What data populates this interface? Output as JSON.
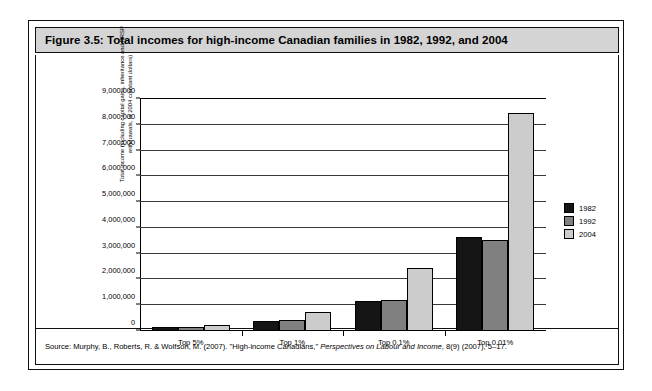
{
  "figure": {
    "title": "Figure 3.5: Total incomes for high-income Canadian families in 1982, 1992, and 2004",
    "source_prefix": "Source: Murphy, B., Roberts, R. & Wolfson, M. (2007). \"High-income Canadians,\" ",
    "source_italic": "Perspectives on Labour and Income",
    "source_suffix": ", 8(9) (2007), 5–17."
  },
  "colors": {
    "y1982": "#151515",
    "y1992": "#808080",
    "y2004": "#cccccc",
    "title_band": "#d4d4d4",
    "frame": "#101010"
  },
  "chart_data": {
    "type": "bar",
    "title": "Figure 3.5: Total incomes for high-income Canadian families in 1982, 1992, and 2004",
    "xlabel": "",
    "ylabel": "Total income (including capital gains, inheritance and RRSP withdrawals, in 2004 constant dollars)",
    "ylabel_line1": "Total income (including capital gains, inheritance and RRSP",
    "ylabel_line2": "withdrawals, in 2004 constant dollars)",
    "categories": [
      "Top 5%",
      "Top 1%",
      "Top 0.1%",
      "Top 0.01%"
    ],
    "series": [
      {
        "name": "1982",
        "values": [
          150000,
          400000,
          1150000,
          3630000
        ]
      },
      {
        "name": "1992",
        "values": [
          160000,
          430000,
          1200000,
          3530000
        ]
      },
      {
        "name": "2004",
        "values": [
          250000,
          740000,
          2450000,
          8450000
        ]
      }
    ],
    "ylim": [
      0,
      9000000
    ],
    "ytick_values": [
      0,
      1000000,
      2000000,
      3000000,
      4000000,
      5000000,
      6000000,
      7000000,
      8000000,
      9000000
    ],
    "ytick_labels": [
      "0",
      "1,000,000",
      "2,000,000",
      "3,000,000",
      "4,000,000",
      "5,000,000",
      "6,000,000",
      "7,000,000",
      "8,000,000",
      "9,000,000"
    ],
    "grid": true,
    "legend_position": "right",
    "legend_entries": [
      "1982",
      "1992",
      "2004"
    ]
  }
}
